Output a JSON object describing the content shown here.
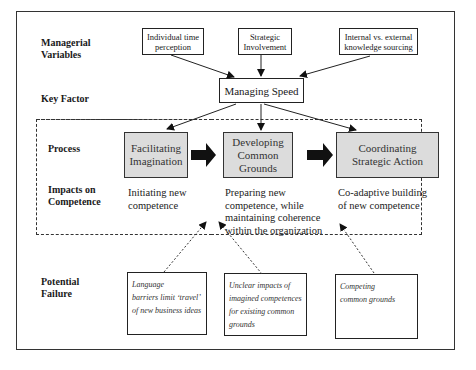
{
  "row_labels": {
    "managerial_variables": [
      "Managerial",
      "Variables"
    ],
    "key_factor": "Key Factor",
    "process": "Process",
    "impacts": [
      "Impacts on",
      "Competence"
    ],
    "potential_failure": [
      "Potential",
      "Failure"
    ]
  },
  "managerial_variables": [
    {
      "lines": [
        "Individual time",
        "perception"
      ]
    },
    {
      "lines": [
        "Strategic",
        "Involvement"
      ]
    },
    {
      "lines": [
        "Internal vs. external",
        "knowledge sourcing"
      ]
    }
  ],
  "key_factor": "Managing Speed",
  "process_steps": [
    {
      "lines": [
        "Facilitating",
        "Imagination"
      ]
    },
    {
      "lines": [
        "Developing",
        "Common",
        "Grounds"
      ]
    },
    {
      "lines": [
        "Coordinating",
        "Strategic Action"
      ]
    }
  ],
  "impacts": [
    {
      "lines": [
        "Initiating new",
        "competence"
      ]
    },
    {
      "lines": [
        "Preparing new",
        "competence, while",
        "maintaining coherence",
        "within the organization"
      ]
    },
    {
      "lines": [
        "Co-adaptive building",
        "of new competence"
      ]
    }
  ],
  "failures": [
    {
      "lines": [
        "Language",
        "barriers limit ‘travel’",
        "of new business ideas"
      ]
    },
    {
      "lines": [
        "Unclear impacts of",
        "imagined  competences",
        "for existing common",
        "grounds"
      ]
    },
    {
      "lines": [
        "Competing",
        "common grounds"
      ]
    }
  ],
  "colors": {
    "process_fill": "#dcdcdc",
    "line": "#222222"
  }
}
